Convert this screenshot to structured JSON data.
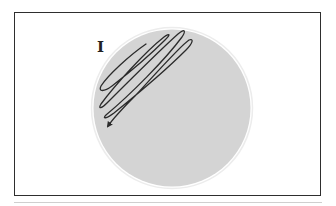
{
  "figure": {
    "section_label": "I",
    "plate": {
      "fill_color": "#d4d4d4",
      "rim_color": "#ececec"
    },
    "streak": {
      "color": "#2b2b2b",
      "direction": "down-left",
      "has_arrowhead": true
    },
    "frame_color": "#2e2e2e",
    "rule_color": "#cfcfcf"
  }
}
